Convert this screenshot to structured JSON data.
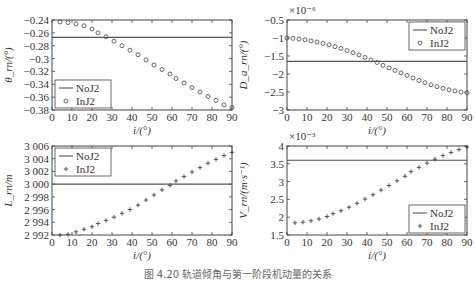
{
  "caption": "图 4.20   轨道倾角与第一阶段机动量的关系",
  "chart_data": [
    {
      "type": "line",
      "panel": "top-left",
      "title": "",
      "xlabel": "i/(°)",
      "ylabel": "θ_rn/(°)",
      "xlim": [
        0,
        90
      ],
      "ylim": [
        -0.38,
        -0.24
      ],
      "xticks": [
        0,
        10,
        20,
        30,
        40,
        50,
        60,
        70,
        80,
        90
      ],
      "yticks": [
        -0.24,
        -0.26,
        -0.28,
        -0.3,
        -0.32,
        -0.34,
        -0.36,
        -0.38
      ],
      "ytick_labels": [
        "−0.24",
        "−0.26",
        "−0.28",
        "−0.3",
        "−0.32",
        "−0.34",
        "−0.36",
        "−0.38"
      ],
      "exponent_label": "",
      "legend": {
        "position": "lower-left",
        "entries": [
          "NoJ2",
          "InJ2"
        ]
      },
      "marker": "circle",
      "series": [
        {
          "name": "NoJ2",
          "style": "line",
          "x": [
            0,
            90
          ],
          "values": [
            -0.267,
            -0.267
          ]
        },
        {
          "name": "InJ2",
          "style": "marker",
          "x": [
            4,
            8,
            12,
            16,
            20,
            23,
            27,
            31,
            35,
            39,
            43,
            47,
            51,
            55,
            59,
            62,
            66,
            70,
            74,
            78,
            82,
            86,
            90
          ],
          "values": [
            -0.243,
            -0.244,
            -0.246,
            -0.249,
            -0.254,
            -0.26,
            -0.266,
            -0.273,
            -0.28,
            -0.287,
            -0.294,
            -0.302,
            -0.31,
            -0.317,
            -0.324,
            -0.331,
            -0.338,
            -0.345,
            -0.352,
            -0.359,
            -0.365,
            -0.372,
            -0.376
          ]
        }
      ]
    },
    {
      "type": "line",
      "panel": "top-right",
      "title": "",
      "xlabel": "i/(°)",
      "ylabel": "D_a_rn/(°)",
      "xlim": [
        0,
        90
      ],
      "ylim": [
        -3,
        -0.5
      ],
      "xticks": [
        0,
        10,
        20,
        30,
        40,
        50,
        60,
        70,
        80,
        90
      ],
      "yticks": [
        -0.5,
        -1,
        -1.5,
        -2,
        -2.5,
        -3
      ],
      "ytick_labels": [
        "−0.5",
        "−1",
        "−1.5",
        "−2",
        "−2.5",
        "−3"
      ],
      "exponent_label": "×10⁻⁶",
      "legend": {
        "position": "upper-right",
        "entries": [
          "NoJ2",
          "InJ2"
        ]
      },
      "marker": "circle",
      "series": [
        {
          "name": "NoJ2",
          "style": "line",
          "x": [
            0,
            90
          ],
          "values": [
            -1.65,
            -1.65
          ]
        },
        {
          "name": "InJ2",
          "style": "marker",
          "x": [
            0,
            3,
            6,
            9,
            12,
            15,
            18,
            21,
            24,
            27,
            30,
            33,
            36,
            39,
            42,
            45,
            48,
            51,
            54,
            57,
            60,
            63,
            66,
            69,
            72,
            75,
            78,
            81,
            84,
            87,
            90
          ],
          "values": [
            -1.0,
            -1.01,
            -1.03,
            -1.05,
            -1.08,
            -1.11,
            -1.15,
            -1.19,
            -1.24,
            -1.29,
            -1.35,
            -1.41,
            -1.47,
            -1.54,
            -1.61,
            -1.68,
            -1.76,
            -1.83,
            -1.9,
            -1.97,
            -2.04,
            -2.11,
            -2.18,
            -2.24,
            -2.3,
            -2.35,
            -2.4,
            -2.44,
            -2.47,
            -2.5,
            -2.52
          ]
        }
      ]
    },
    {
      "type": "line",
      "panel": "bottom-left",
      "title": "",
      "xlabel": "i/(°)",
      "ylabel": "L_rn/m",
      "xlim": [
        0,
        90
      ],
      "ylim": [
        2992,
        3006
      ],
      "xticks": [
        0,
        10,
        20,
        30,
        40,
        50,
        60,
        70,
        80,
        90
      ],
      "yticks": [
        3006,
        3004,
        3002,
        3000,
        2998,
        2996,
        2994,
        2992
      ],
      "ytick_labels": [
        "3 006",
        "3 004",
        "3 002",
        "3 000",
        "2 998",
        "2 996",
        "2 994",
        "2 992"
      ],
      "exponent_label": "",
      "legend": {
        "position": "upper-left",
        "entries": [
          "NoJ2",
          "InJ2"
        ]
      },
      "marker": "plus",
      "series": [
        {
          "name": "NoJ2",
          "style": "line",
          "x": [
            0,
            90
          ],
          "values": [
            3000,
            3000
          ]
        },
        {
          "name": "InJ2",
          "style": "marker",
          "x": [
            4,
            8,
            12,
            16,
            20,
            23,
            27,
            31,
            35,
            39,
            43,
            47,
            51,
            55,
            59,
            62,
            66,
            70,
            74,
            78,
            82,
            86,
            90
          ],
          "values": [
            2992.0,
            2992.1,
            2992.5,
            2992.9,
            2993.3,
            2993.8,
            2994.3,
            2994.8,
            2995.4,
            2996.0,
            2996.7,
            2997.5,
            2998.3,
            2999.1,
            2999.8,
            3000.5,
            3001.2,
            3001.9,
            3002.6,
            3003.3,
            3003.9,
            3004.5,
            3005.0
          ]
        }
      ]
    },
    {
      "type": "line",
      "panel": "bottom-right",
      "title": "",
      "xlabel": "i/(°)",
      "ylabel": "V_rn/(m·s⁻¹)",
      "xlim": [
        0,
        90
      ],
      "ylim": [
        1.5,
        4
      ],
      "xticks": [
        0,
        10,
        20,
        30,
        40,
        50,
        60,
        70,
        80,
        90
      ],
      "yticks": [
        4,
        3.5,
        3,
        2.5,
        2,
        1.5
      ],
      "ytick_labels": [
        "4",
        "3.5",
        "3",
        "2.5",
        "2",
        "1.5"
      ],
      "exponent_label": "×10⁻³",
      "legend": {
        "position": "lower-right",
        "entries": [
          "NoJ2",
          "InJ2"
        ]
      },
      "marker": "plus",
      "series": [
        {
          "name": "NoJ2",
          "style": "line",
          "x": [
            0,
            90
          ],
          "values": [
            3.6,
            3.6
          ]
        },
        {
          "name": "InJ2",
          "style": "marker",
          "x": [
            4,
            8,
            12,
            16,
            20,
            23,
            27,
            31,
            35,
            39,
            43,
            47,
            51,
            55,
            59,
            62,
            66,
            70,
            74,
            78,
            82,
            86,
            90
          ],
          "values": [
            1.84,
            1.86,
            1.9,
            1.95,
            2.02,
            2.1,
            2.18,
            2.28,
            2.39,
            2.51,
            2.63,
            2.76,
            2.89,
            3.02,
            3.15,
            3.28,
            3.4,
            3.52,
            3.63,
            3.73,
            3.82,
            3.9,
            3.97
          ]
        }
      ]
    }
  ]
}
